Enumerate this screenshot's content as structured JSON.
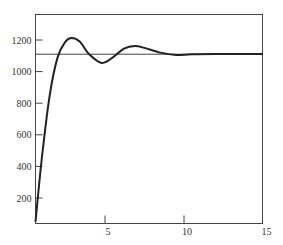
{
  "chart_data": {
    "type": "line",
    "title": "",
    "xlabel": "",
    "ylabel": "",
    "xlim": [
      0.6,
      15
    ],
    "ylim": [
      40,
      1330
    ],
    "x_ticks": [
      5,
      10,
      15
    ],
    "y_ticks": [
      200,
      400,
      600,
      800,
      1000,
      1200
    ],
    "x_tick_labels": [
      "5",
      "10",
      "15"
    ],
    "y_tick_labels": [
      "200",
      "400",
      "600",
      "800",
      "1000",
      "1200"
    ],
    "grid": false,
    "legend": null,
    "reference_line": {
      "y": 1110,
      "label": ""
    },
    "series": [
      {
        "name": "response",
        "x": [
          0.6,
          1.0,
          1.5,
          2.0,
          2.5,
          2.9,
          3.4,
          4.0,
          4.8,
          5.5,
          6.2,
          6.9,
          7.5,
          8.5,
          9.5,
          10.5,
          12,
          15
        ],
        "y": [
          50,
          450,
          850,
          1090,
          1190,
          1213,
          1190,
          1110,
          1055,
          1090,
          1145,
          1162,
          1150,
          1120,
          1105,
          1110,
          1112,
          1112
        ]
      }
    ]
  }
}
